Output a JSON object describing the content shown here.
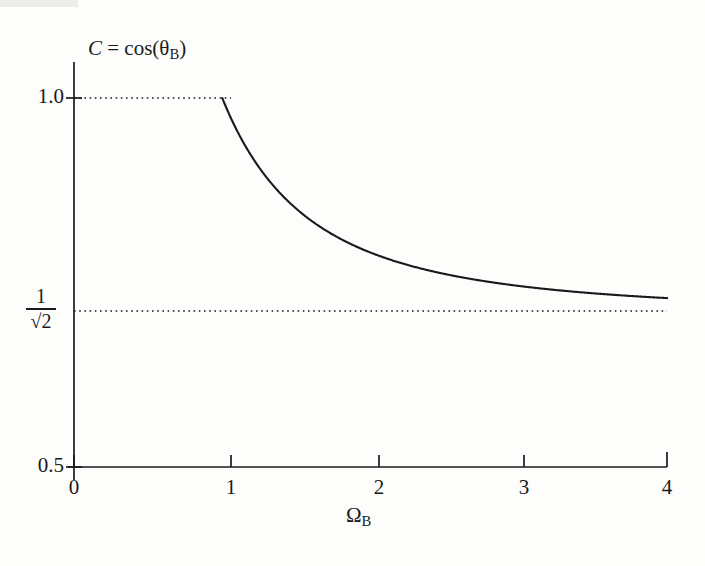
{
  "figure": {
    "background_color": "#fdfdfc",
    "ink_color": "#1a1a1a"
  },
  "labels": {
    "y_axis_title_prefix": "C",
    "y_axis_title_equals": " = cos(",
    "y_axis_title_theta": "θ",
    "y_axis_title_sub": "B",
    "y_axis_title_close": ")",
    "y_axis_title_plain": "C = cos(θB)",
    "x_axis_title_omega": "Ω",
    "x_axis_title_sub": "B",
    "x_axis_title_plain": "ΩB",
    "ytick_top": "1.0",
    "ytick_bottom": "0.5",
    "ytick_fraction_numerator": "1",
    "ytick_fraction_denominator": "√2",
    "xtick_0": "0",
    "xtick_1": "1",
    "xtick_2": "2",
    "xtick_3": "3",
    "xtick_4": "4"
  },
  "chart_data": {
    "type": "line",
    "title": "",
    "xlabel": "ΩB",
    "ylabel": "C = cos(θB)",
    "xlim": [
      0,
      4
    ],
    "ylim": [
      0.5,
      1.0
    ],
    "xticks": [
      0,
      1,
      2,
      3,
      4
    ],
    "yticks": [
      0.5,
      1.0
    ],
    "grid": false,
    "legend": null,
    "annotations": [
      {
        "name": "asymptote-value",
        "text": "1/√2",
        "value": 0.7071,
        "axis": "y",
        "style": "dotted-horizontal-line"
      },
      {
        "name": "unity-reference",
        "text": "1.0",
        "value": 1.0,
        "axis": "y",
        "style": "dotted-horizontal-line"
      }
    ],
    "series": [
      {
        "name": "C = cos(theta_B)",
        "style": "solid",
        "description": "C = sqrt((Omega^2 + 1) / (2 * Omega^2)) for Omega >= 1; equals 1.0 for Omega < 1",
        "x": [
          1.0,
          1.05,
          1.1,
          1.15,
          1.2,
          1.25,
          1.3,
          1.35,
          1.4,
          1.45,
          1.5,
          1.6,
          1.7,
          1.8,
          1.9,
          2.0,
          2.2,
          2.4,
          2.6,
          2.8,
          3.0,
          3.2,
          3.4,
          3.6,
          3.8,
          4.0
        ],
        "y": [
          1.0,
          0.9781,
          0.9593,
          0.9431,
          0.9292,
          0.9171,
          0.9066,
          0.8974,
          0.8894,
          0.8823,
          0.876,
          0.8655,
          0.8572,
          0.8505,
          0.845,
          0.8405,
          0.8336,
          0.8286,
          0.8249,
          0.8221,
          0.8199,
          0.8182,
          0.8168,
          0.8157,
          0.8148,
          0.8141
        ]
      },
      {
        "name": "unity-plateau",
        "style": "dotted",
        "description": "Dotted reference segment at C = 1.0 spanning Omega = 0 to 1",
        "x": [
          0.0,
          1.0
        ],
        "y": [
          1.0,
          1.0
        ]
      },
      {
        "name": "asymptote-line",
        "style": "dotted",
        "description": "Dotted horizontal asymptote at C = 1/sqrt(2)",
        "x": [
          0.0,
          4.0
        ],
        "y": [
          0.7071,
          0.7071
        ]
      }
    ]
  }
}
